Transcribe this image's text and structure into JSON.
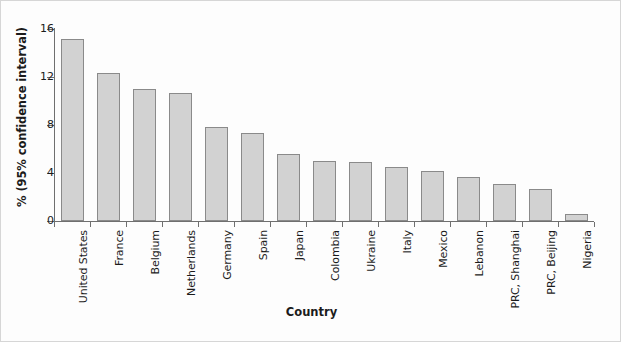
{
  "chart_data": {
    "type": "bar",
    "title": "",
    "xlabel": "Country",
    "ylabel": "% (95% confidence interval)",
    "ylim": [
      0,
      16
    ],
    "yticks": [
      0,
      4,
      8,
      12,
      16
    ],
    "ytick_labels": [
      "0",
      "4",
      "8",
      "12",
      "16"
    ],
    "grid": false,
    "legend": null,
    "bar_facecolor": "#d2d2d2",
    "bar_edgecolor": "#8a8a8a",
    "axis_color": "#6f6f6f",
    "categories": [
      "United States",
      "France",
      "Belgium",
      "Netherlands",
      "Germany",
      "Spain",
      "Japan",
      "Colombia",
      "Ukraine",
      "Italy",
      "Mexico",
      "Lebanon",
      "PRC, Shanghai",
      "PRC, Beijing",
      "Nigeria"
    ],
    "values": [
      15.2,
      12.3,
      11.0,
      10.7,
      7.8,
      7.3,
      5.6,
      5.0,
      4.9,
      4.5,
      4.2,
      3.7,
      3.1,
      2.7,
      0.6
    ]
  }
}
